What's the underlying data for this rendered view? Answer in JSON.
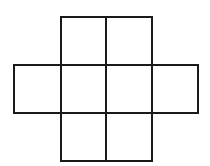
{
  "diagram": {
    "type": "grid-net",
    "stroke_color": "#1a1a1a",
    "background_color": "#ffffff",
    "stroke_width": 2,
    "cells": [
      {
        "row": 0,
        "col": 1,
        "x": 61,
        "y": 17,
        "w": 45,
        "h": 48
      },
      {
        "row": 0,
        "col": 2,
        "x": 106,
        "y": 17,
        "w": 46,
        "h": 48
      },
      {
        "row": 1,
        "col": 0,
        "x": 14,
        "y": 65,
        "w": 47,
        "h": 48
      },
      {
        "row": 1,
        "col": 1,
        "x": 61,
        "y": 65,
        "w": 45,
        "h": 48
      },
      {
        "row": 1,
        "col": 2,
        "x": 106,
        "y": 65,
        "w": 46,
        "h": 48
      },
      {
        "row": 1,
        "col": 3,
        "x": 152,
        "y": 65,
        "w": 46,
        "h": 48
      },
      {
        "row": 2,
        "col": 1,
        "x": 61,
        "y": 113,
        "w": 45,
        "h": 48
      },
      {
        "row": 2,
        "col": 2,
        "x": 106,
        "y": 113,
        "w": 46,
        "h": 48
      }
    ]
  }
}
